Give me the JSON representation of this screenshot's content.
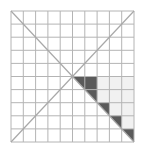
{
  "figure": {
    "grid": {
      "cols": 10,
      "rows": 10,
      "x0": 11,
      "y0": 11,
      "x1": 134,
      "y1": 142
    },
    "colors": {
      "background": "#ffffff",
      "grid_line": "#b4b4b4",
      "diagonal": "#a8a8a8",
      "dark_fill": "#5a5a5a",
      "light_fill": "#f1f1f1"
    },
    "dark_triangles": [
      {
        "cells": "cols 5-6, rows 5-6",
        "points": [
          [
            5,
            5
          ],
          [
            7,
            5
          ],
          [
            7,
            7
          ]
        ]
      },
      {
        "cells": "col 7, row 7",
        "points": [
          [
            7,
            7
          ],
          [
            8,
            7
          ],
          [
            8,
            8
          ]
        ]
      },
      {
        "cells": "col 8, row 8",
        "points": [
          [
            8,
            8
          ],
          [
            9,
            8
          ],
          [
            9,
            9
          ]
        ]
      },
      {
        "cells": "col 9, row 9",
        "points": [
          [
            9,
            9
          ],
          [
            10,
            9
          ],
          [
            10,
            10
          ]
        ]
      }
    ],
    "light_region": {
      "points": [
        [
          7,
          5
        ],
        [
          10,
          5
        ],
        [
          10,
          9
        ],
        [
          9,
          9
        ],
        [
          9,
          8
        ],
        [
          8,
          8
        ],
        [
          8,
          7
        ],
        [
          7,
          7
        ]
      ]
    }
  }
}
